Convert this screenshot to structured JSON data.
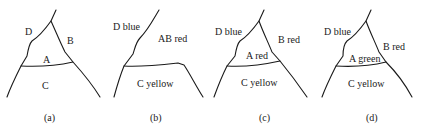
{
  "figure": {
    "panels": [
      {
        "caption": "(a)",
        "regions": {
          "D": "D",
          "B": "B",
          "A": "A",
          "C": "C"
        }
      },
      {
        "caption": "(b)",
        "regions": {
          "D": "D blue",
          "AB": "AB red",
          "C": "C yellow"
        }
      },
      {
        "caption": "(c)",
        "regions": {
          "D": "D blue",
          "B": "B red",
          "A": "A red",
          "C": "C yellow"
        }
      },
      {
        "caption": "(d)",
        "regions": {
          "D": "D blue",
          "B": "B red",
          "A": "A green",
          "C": "C yellow"
        }
      }
    ]
  }
}
